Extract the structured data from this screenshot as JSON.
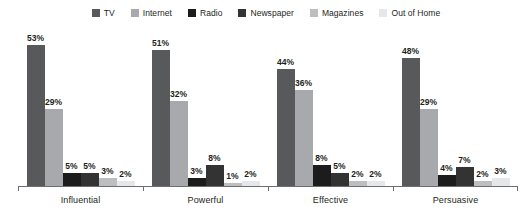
{
  "chart_data": {
    "type": "bar",
    "title": "",
    "subtitle": "",
    "xlabel": "",
    "ylabel": "",
    "ylim": [
      0,
      60
    ],
    "grid": false,
    "legend_position": "top-center",
    "value_suffix": "%",
    "categories": [
      "Influential",
      "Powerful",
      "Effective",
      "Persuasive"
    ],
    "series": [
      {
        "name": "TV",
        "color": "#58595b",
        "values": [
          53,
          51,
          44,
          48
        ],
        "labels": [
          "53%",
          "51%",
          "44%",
          "48%"
        ]
      },
      {
        "name": "Internet",
        "color": "#a7a9ac",
        "values": [
          29,
          32,
          36,
          29
        ],
        "labels": [
          "29%",
          "32%",
          "36%",
          "29%"
        ]
      },
      {
        "name": "Radio",
        "color": "#1c1c1c",
        "values": [
          5,
          3,
          8,
          4
        ],
        "labels": [
          "5%",
          "3%",
          "8%",
          "4%"
        ]
      },
      {
        "name": "Newspaper",
        "color": "#333333",
        "values": [
          5,
          8,
          5,
          7
        ],
        "labels": [
          "5%",
          "8%",
          "5%",
          "7%"
        ]
      },
      {
        "name": "Magazines",
        "color": "#bcbec0",
        "values": [
          3,
          1,
          2,
          2
        ],
        "labels": [
          "3%",
          "1%",
          "2%",
          "2%"
        ]
      },
      {
        "name": "Out of Home",
        "color": "#e6e7e8",
        "values": [
          2,
          2,
          2,
          3
        ],
        "labels": [
          "2%",
          "2%",
          "2%",
          "3%"
        ]
      }
    ]
  },
  "axis": {
    "line_color": "#6d6e71"
  }
}
